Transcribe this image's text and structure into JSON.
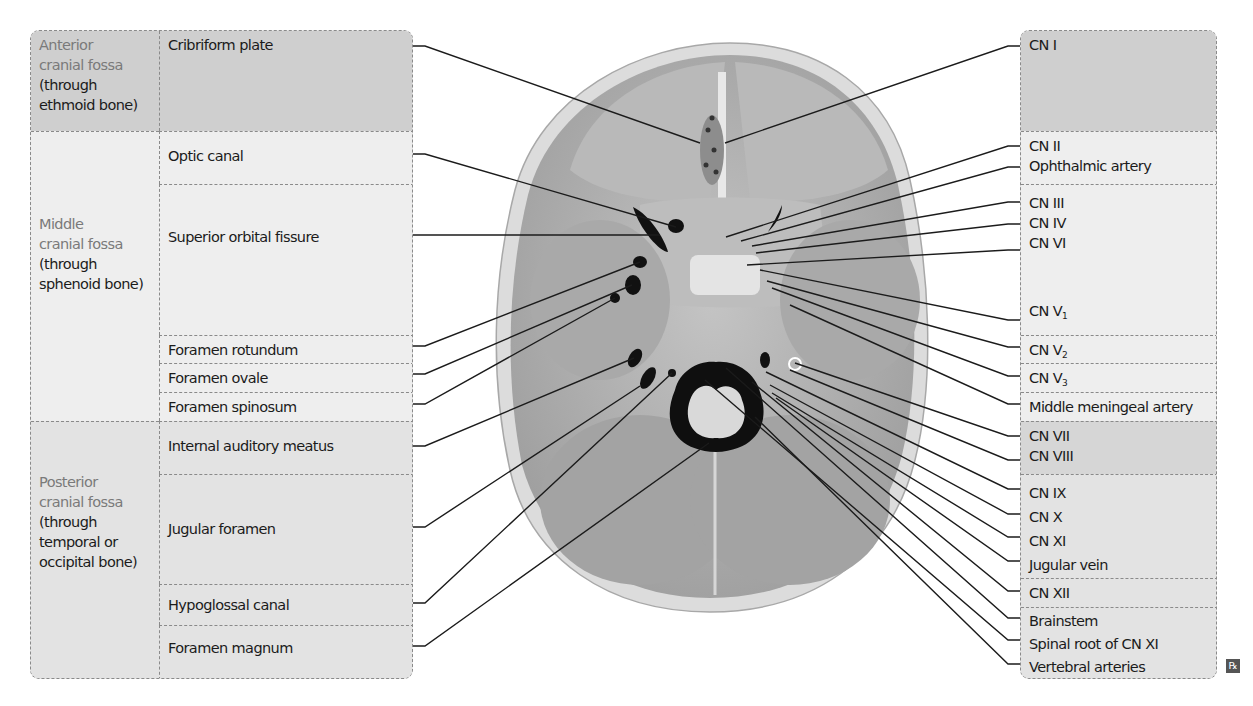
{
  "left_table": {
    "regions": [
      {
        "name": "Anterior",
        "name2": "cranial fossa",
        "sub1": "(through",
        "sub2": "ethmoid bone)",
        "sub3": ""
      },
      {
        "name": "Middle",
        "name2": "cranial fossa",
        "sub1": "(through",
        "sub2": "sphenoid bone)",
        "sub3": ""
      },
      {
        "name": "Posterior",
        "name2": "cranial fossa",
        "sub1": "(through",
        "sub2": "temporal or",
        "sub3": "occipital bone)"
      }
    ],
    "openings": [
      "Cribriform plate",
      "Optic canal",
      "Superior orbital fissure",
      "Foramen rotundum",
      "Foramen ovale",
      "Foramen spinosum",
      "Internal auditory meatus",
      "Jugular foramen",
      "Hypoglossal canal",
      "Foramen magnum"
    ]
  },
  "right_table": {
    "groups": [
      {
        "items": [
          "CN I"
        ]
      },
      {
        "items": [
          "CN II",
          "Ophthalmic artery"
        ]
      },
      {
        "items": [
          "CN III",
          "CN IV",
          "CN VI"
        ],
        "extra": {
          "base": "CN V",
          "sub": "1"
        }
      },
      {
        "items": [],
        "extra": {
          "base": "CN V",
          "sub": "2"
        }
      },
      {
        "items": [],
        "extra": {
          "base": "CN V",
          "sub": "3"
        }
      },
      {
        "items": [
          "Middle meningeal artery"
        ]
      },
      {
        "items": [
          "CN VII",
          "CN VIII"
        ]
      },
      {
        "items": [
          "CN IX",
          "CN X",
          "CN XI",
          "Jugular vein"
        ]
      },
      {
        "items": [
          "CN XII"
        ]
      },
      {
        "items": [
          "Brainstem",
          "Spinal root of CN XI",
          "Vertebral arteries"
        ]
      }
    ]
  },
  "colors": {
    "anterior_bg": "#cfcfcf",
    "middle_bg": "#eeeeee",
    "posterior_bg": "#e3e3e3",
    "region_name_text": "#7a7a7a",
    "leader_line": "#1b1b1b"
  },
  "illustration": {
    "name": "Skull base (superior view) with foramina"
  },
  "badge": {
    "label": "℞"
  }
}
